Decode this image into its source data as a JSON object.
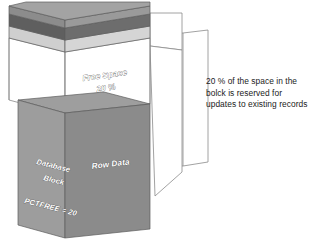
{
  "diagram": {
    "type": "isometric-3d-block-diagram",
    "background_color": "#ffffff"
  },
  "block": {
    "labels": {
      "free_space_title": "Free Space",
      "free_space_value": "20 %",
      "left_face_line1": "Database",
      "left_face_line2": "Block",
      "left_face_line3": "PCTFREE = 20",
      "front_face": "Row Data"
    },
    "segments": [
      {
        "name": "block-header-top-face",
        "color": "#a0a0a0"
      },
      {
        "name": "block-header-dark-band",
        "color": "#6d6d6d"
      },
      {
        "name": "block-header-light-band",
        "color": "#c9c9c9"
      },
      {
        "name": "free-space-region",
        "color": "#ffffff"
      },
      {
        "name": "row-data-top-face",
        "color": "#9b9b9b"
      },
      {
        "name": "row-data-front-face",
        "color": "#8e8e8e"
      },
      {
        "name": "row-data-left-face",
        "color": "#9d9d9d"
      }
    ]
  },
  "callout": {
    "name": "free-space-callout",
    "lines": [
      "20 % of the space in the",
      "bolck is reserved for",
      "updates to existing records"
    ],
    "text_color": "#1b1b1b",
    "leader_stroke_color": "#8a8a8a"
  }
}
